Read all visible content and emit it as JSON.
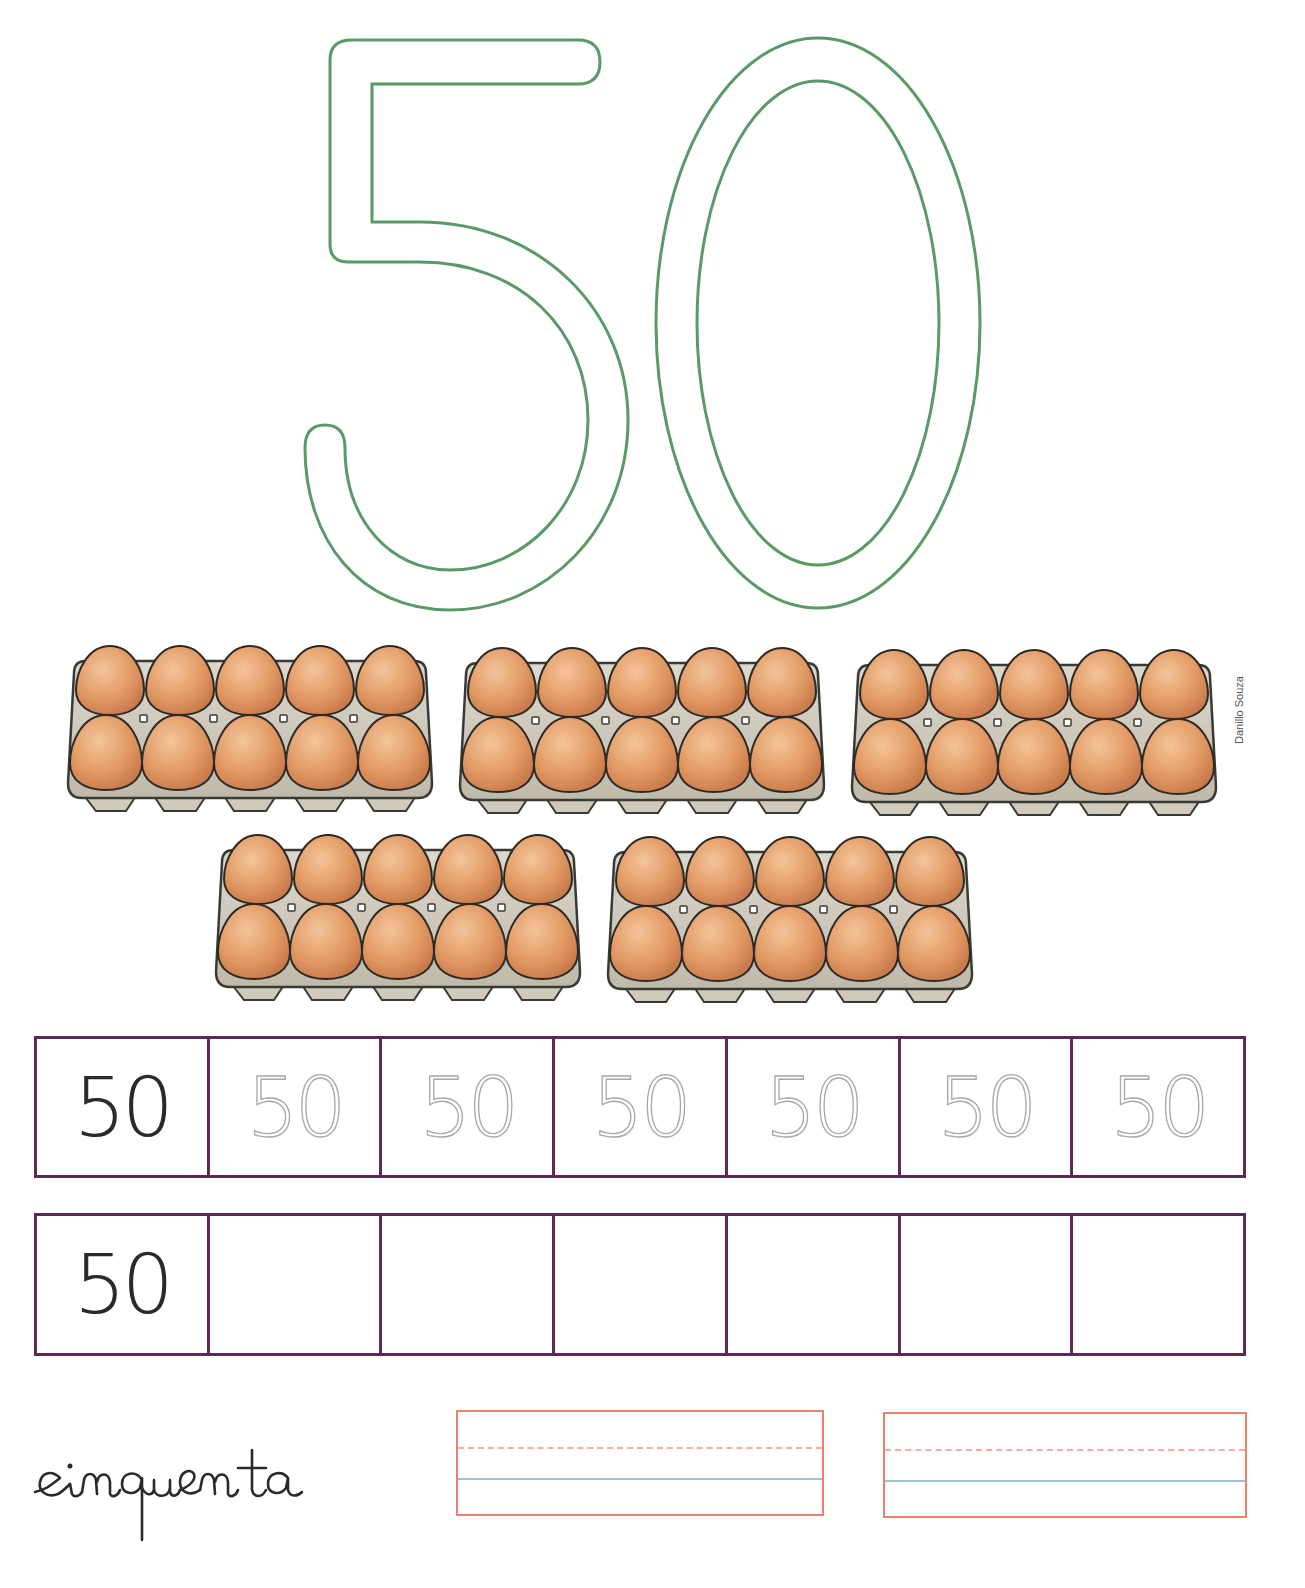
{
  "page": {
    "number": "50",
    "number_word": "cinquenta",
    "credit": "Danillo Souza",
    "colors": {
      "outline_number": "#5a9a66",
      "grid_border": "#5c2a55",
      "model_text": "#2a2a2a",
      "trace_text": "#a8a8a8",
      "writing_box": "#e8826a",
      "writing_midline": "#f0b0a0",
      "writing_baseline": "#9cc4d0",
      "egg": "#dd9a66",
      "carton": "#cfcabc"
    }
  },
  "illustration": {
    "cartons": 5,
    "eggs_per_carton": 10,
    "total_eggs": 50
  },
  "practice_rows": [
    {
      "cells": [
        "50",
        "50",
        "50",
        "50",
        "50",
        "50",
        "50"
      ],
      "styles": [
        "model",
        "trace",
        "trace",
        "trace",
        "trace",
        "trace",
        "trace"
      ]
    },
    {
      "cells": [
        "50",
        "",
        "",
        "",
        "",
        "",
        ""
      ],
      "styles": [
        "model",
        "empty",
        "empty",
        "empty",
        "empty",
        "empty",
        "empty"
      ]
    }
  ],
  "writing_boxes": 2
}
